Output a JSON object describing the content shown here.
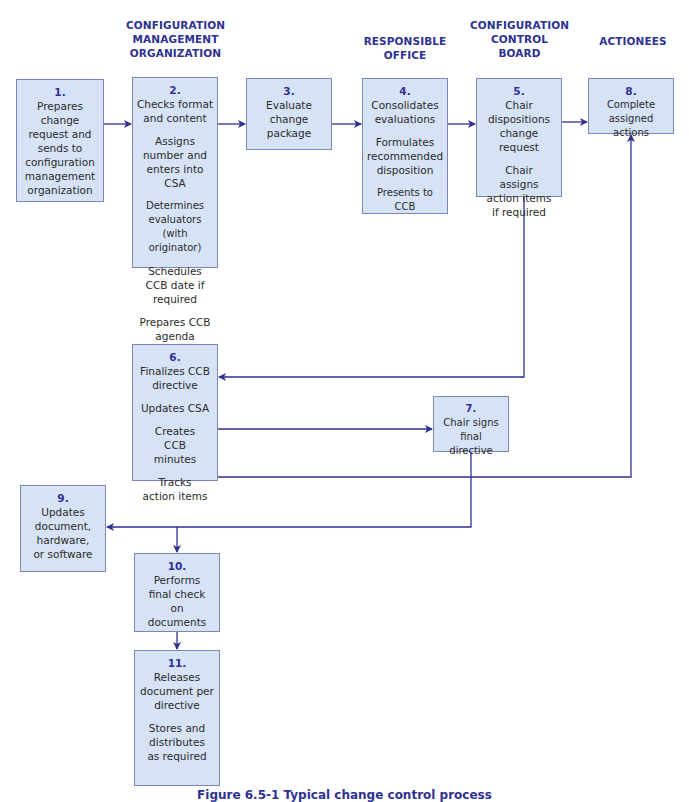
{
  "colors": {
    "accent": "#2e3192",
    "box_fill": "#d6e2f5",
    "box_border": "#7b86b3",
    "arrow": "#2e3192"
  },
  "headers": {
    "originator": "ORIGINATOR",
    "cmo_1": "CONFIGURATION",
    "cmo_2": "MANAGEMENT",
    "cmo_3": "ORGANIZATION",
    "evaluators": "EVALUATORS",
    "ro_1": "RESPONSIBLE",
    "ro_2": "OFFICE",
    "ccb_1": "CONFIGURATION",
    "ccb_2": "CONTROL",
    "ccb_3": "BOARD",
    "actionees": "ACTIONEES"
  },
  "steps": {
    "s1": {
      "num": "1.",
      "lines": [
        "Prepares change request and sends to configuration management organization"
      ]
    },
    "s2": {
      "num": "2.",
      "lines": [
        "Checks format and content",
        "Assigns number and enters into CSA",
        "Determines evaluators (with originator)",
        "Schedules CCB date if required",
        "Prepares CCB agenda"
      ]
    },
    "s3": {
      "num": "3.",
      "lines": [
        "Evaluate change package"
      ]
    },
    "s4": {
      "num": "4.",
      "lines": [
        "Consolidates evaluations",
        "Formulates recommended disposition",
        "Presents to CCB"
      ]
    },
    "s5": {
      "num": "5.",
      "lines": [
        "Chair dispositions change request",
        "Chair assigns action items if required"
      ]
    },
    "s6": {
      "num": "6.",
      "lines": [
        "Finalizes CCB directive",
        "Updates CSA",
        "Creates CCB minutes",
        "Tracks action items"
      ]
    },
    "s7": {
      "num": "7.",
      "lines": [
        "Chair signs final directive"
      ]
    },
    "s8": {
      "num": "8.",
      "lines": [
        "Complete assigned actions"
      ]
    },
    "s9": {
      "num": "9.",
      "lines": [
        "Updates document, hardware, or software"
      ]
    },
    "s10": {
      "num": "10.",
      "lines": [
        "Performs final check on documents"
      ]
    },
    "s11": {
      "num": "11.",
      "lines": [
        "Releases document per directive",
        "Stores and distributes as required"
      ]
    }
  },
  "caption": "Figure 6.5-1 Typical change control process"
}
